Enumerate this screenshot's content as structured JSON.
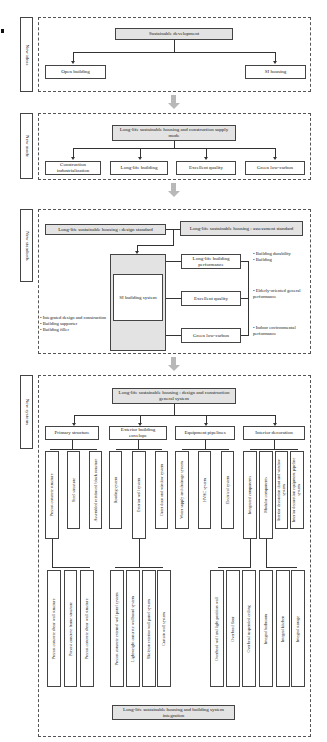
{
  "figure_mark": "b",
  "sections": {
    "ideas": {
      "label": "New ideas",
      "root": "Sustainable development",
      "children": [
        "Open building",
        "SI housing"
      ]
    },
    "mode": {
      "label": "New mode",
      "root": "Long-life sustainable housing and construction supply mode",
      "children": [
        "Construction industrialization",
        "Long-life building",
        "Excellent quality",
        "Green low-carbon"
      ]
    },
    "standards": {
      "label": "New standards",
      "design_standard": "Long-life sustainable housing : design standard",
      "assessment_standard": "Long-life sustainable housing : assessment standard",
      "core": "SI building system",
      "performance": [
        "Long-life building performance",
        "Excellent quality",
        "Green low-carbon"
      ],
      "left_bullets": [
        "• Integrated design and construction",
        "• Building supporter",
        "• Building filler"
      ],
      "right_bullets": [
        [
          "• Building durability",
          "• Building"
        ],
        [
          "• Elderly-oriented general performance"
        ],
        [
          "• Indoor environmental performance"
        ]
      ]
    },
    "systems": {
      "label": "New systems",
      "root": "Long-life sustainable housing : design and construction general system",
      "categories": [
        {
          "name": "Primary structure",
          "items": [
            "Precast concrete structure",
            "Steel structure",
            "Assembled reinforced block structure"
          ],
          "subitems": [
            "Precast concrete shear wall structure",
            "Precast concrete frame structure",
            "Precast concrete shear wall structure"
          ]
        },
        {
          "name": "Exterior building envelope",
          "items": [
            "Roofing system",
            "Exterior wall system",
            "Outer door and window system"
          ],
          "subitems": [
            "Precast concrete external wall panel system",
            "Lightweight concrete wallboard system",
            "Skeleton exterior wall panel system",
            "Curtain wall system"
          ]
        },
        {
          "name": "Equipment pipelines",
          "items": [
            "Water supply and drainage system",
            "HVAC system",
            "Electrical system"
          ],
          "subitems": []
        },
        {
          "name": "Interior decoration",
          "items": [
            "Integrated components",
            "Modular components",
            "Interior decoration door and window system",
            "Interior decoration equipment pipeline system"
          ],
          "subitems": [
            "Overhead wall and light partition wall",
            "Overhead floor",
            "Overhead suspended ceiling",
            "Integral bathroom",
            "Integral kitchen",
            "Integral storage"
          ]
        }
      ],
      "integration": "Long-life sustainable housing and building system integration"
    }
  }
}
